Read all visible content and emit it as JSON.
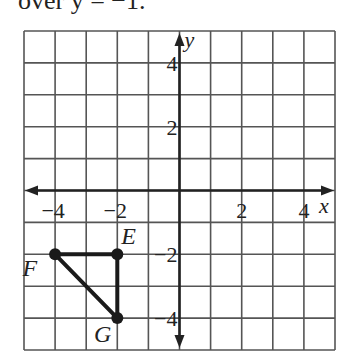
{
  "header_text": "over y = −1.",
  "grid": {
    "cols": 10,
    "rows": 10,
    "x_min": -5,
    "x_max": 5,
    "y_min": -5,
    "y_max": 5,
    "left": 24,
    "top": 31,
    "cell_w": 31.1,
    "cell_h": 31.9
  },
  "axes": {
    "x_label": "x",
    "y_label": "y",
    "x_ticks": [
      {
        "value": -4,
        "text": "−4"
      },
      {
        "value": -2,
        "text": "−2"
      },
      {
        "value": 2,
        "text": "2"
      },
      {
        "value": 4,
        "text": "4"
      }
    ],
    "y_ticks": [
      {
        "value": 4,
        "text": "4"
      },
      {
        "value": 2,
        "text": "2"
      },
      {
        "value": -2,
        "text": "−2"
      },
      {
        "value": -4,
        "text": "−4"
      }
    ]
  },
  "triangle": {
    "points": [
      {
        "name": "E",
        "x": -2,
        "y": -2
      },
      {
        "name": "F",
        "x": -4,
        "y": -2
      },
      {
        "name": "G",
        "x": -2,
        "y": -4
      }
    ]
  },
  "colors": {
    "grid": "#555555",
    "axis": "#222222",
    "shape": "#1a1a1a"
  }
}
